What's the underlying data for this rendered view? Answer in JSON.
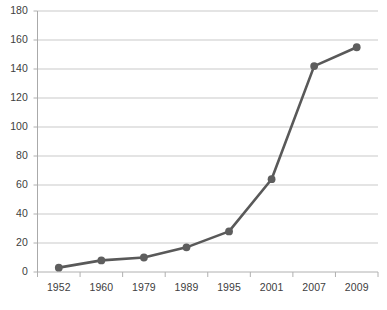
{
  "chart_data": {
    "type": "line",
    "title": "",
    "subtitle": "",
    "xlabel": "",
    "ylabel": "",
    "categories": [
      "1952",
      "1960",
      "1979",
      "1989",
      "1995",
      "2001",
      "2007",
      "2009"
    ],
    "x": [
      "1952",
      "1960",
      "1979",
      "1989",
      "1995",
      "2001",
      "2007",
      "2009"
    ],
    "values": [
      3,
      8,
      10,
      17,
      28,
      64,
      142,
      155
    ],
    "series": [
      {
        "name": "",
        "values": [
          3,
          8,
          10,
          17,
          28,
          64,
          142,
          155
        ]
      }
    ],
    "ylim": [
      0,
      180
    ],
    "ytick_values": [
      0,
      20,
      40,
      60,
      80,
      100,
      120,
      140,
      160,
      180
    ],
    "ytick_labels": [
      "0",
      "20",
      "40",
      "60",
      "80",
      "100",
      "120",
      "140",
      "160",
      "180"
    ],
    "xtick_labels": [
      "1952",
      "1960",
      "1979",
      "1989",
      "1995",
      "2001",
      "2007",
      "2009"
    ],
    "grid": true,
    "grid_axis": "y",
    "legend": false,
    "legend_position": "none",
    "marker": "circle",
    "annotations": []
  },
  "style": {
    "line_color": "#595959",
    "marker_color": "#5e5e5e",
    "grid_color": "#c9c9c9",
    "axis_color": "#b0b0b0",
    "text_color": "#404040",
    "background": "#ffffff"
  }
}
